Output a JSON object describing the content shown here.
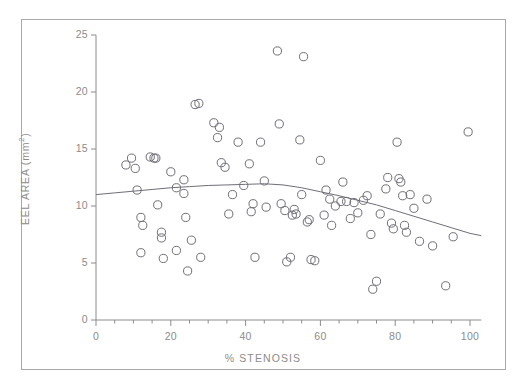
{
  "figure": {
    "background": "#ffffff",
    "frame_color": "#a8a8a8",
    "axis_color": "#8c8c8c",
    "marker_color": "#6e6e78",
    "trend_color": "#6e6e78"
  },
  "axes": {
    "x_title": "% STENOSIS",
    "y_title_main": "EEL AREA (mm",
    "y_title_sup": "2",
    "y_title_tail": ")",
    "x_ticks": [
      "0",
      "20",
      "40",
      "60",
      "80",
      "100"
    ],
    "y_ticks": [
      "0",
      "5",
      "10",
      "15",
      "20",
      "25"
    ]
  },
  "chart_data": {
    "type": "scatter",
    "title": "",
    "xlabel": "% STENOSIS",
    "ylabel": "EEL AREA (mm2)",
    "xlim": [
      0,
      103
    ],
    "ylim": [
      0,
      25
    ],
    "x_major_ticks": [
      0,
      20,
      40,
      60,
      80,
      100
    ],
    "y_major_ticks": [
      0,
      5,
      10,
      15,
      20,
      25
    ],
    "x_minor_tick_step": 5,
    "grid": false,
    "legend": null,
    "marker": "open-circle",
    "series": [
      {
        "name": "observations",
        "points": [
          [
            8.0,
            13.6
          ],
          [
            9.5,
            14.2
          ],
          [
            10.5,
            13.3
          ],
          [
            11.0,
            11.4
          ],
          [
            12.0,
            9.0
          ],
          [
            12.5,
            8.3
          ],
          [
            12.0,
            5.9
          ],
          [
            14.5,
            14.3
          ],
          [
            15.5,
            14.2
          ],
          [
            16.0,
            14.2
          ],
          [
            16.5,
            10.1
          ],
          [
            17.5,
            7.7
          ],
          [
            17.5,
            7.2
          ],
          [
            18.0,
            5.4
          ],
          [
            20.0,
            13.0
          ],
          [
            21.5,
            11.6
          ],
          [
            21.5,
            6.1
          ],
          [
            23.5,
            12.3
          ],
          [
            23.5,
            11.1
          ],
          [
            24.0,
            9.0
          ],
          [
            24.5,
            4.3
          ],
          [
            25.5,
            7.0
          ],
          [
            26.5,
            18.9
          ],
          [
            27.5,
            19.0
          ],
          [
            28.0,
            5.5
          ],
          [
            31.5,
            17.3
          ],
          [
            32.5,
            16.0
          ],
          [
            33.0,
            16.9
          ],
          [
            33.5,
            13.8
          ],
          [
            34.5,
            13.4
          ],
          [
            35.5,
            9.3
          ],
          [
            36.5,
            11.0
          ],
          [
            38.0,
            15.6
          ],
          [
            39.5,
            11.8
          ],
          [
            41.0,
            13.7
          ],
          [
            41.5,
            9.5
          ],
          [
            42.0,
            10.2
          ],
          [
            42.5,
            5.5
          ],
          [
            44.0,
            15.6
          ],
          [
            45.0,
            12.2
          ],
          [
            45.5,
            9.9
          ],
          [
            48.5,
            23.6
          ],
          [
            49.0,
            17.2
          ],
          [
            49.5,
            10.2
          ],
          [
            50.5,
            9.6
          ],
          [
            51.0,
            5.1
          ],
          [
            52.0,
            5.5
          ],
          [
            52.5,
            9.2
          ],
          [
            53.0,
            9.7
          ],
          [
            53.5,
            9.3
          ],
          [
            54.5,
            15.8
          ],
          [
            55.5,
            23.1
          ],
          [
            55.0,
            11.0
          ],
          [
            56.5,
            8.6
          ],
          [
            57.0,
            8.8
          ],
          [
            57.5,
            5.3
          ],
          [
            58.5,
            5.2
          ],
          [
            60.0,
            14.0
          ],
          [
            61.0,
            9.2
          ],
          [
            61.5,
            11.4
          ],
          [
            62.5,
            10.6
          ],
          [
            63.0,
            8.3
          ],
          [
            64.0,
            10.0
          ],
          [
            65.5,
            10.4
          ],
          [
            66.0,
            12.1
          ],
          [
            67.0,
            10.4
          ],
          [
            68.0,
            8.9
          ],
          [
            69.0,
            10.3
          ],
          [
            70.0,
            9.4
          ],
          [
            71.5,
            10.5
          ],
          [
            72.5,
            10.9
          ],
          [
            73.5,
            7.5
          ],
          [
            74.0,
            2.7
          ],
          [
            75.0,
            3.4
          ],
          [
            76.0,
            9.3
          ],
          [
            77.5,
            11.5
          ],
          [
            78.0,
            12.5
          ],
          [
            79.0,
            8.5
          ],
          [
            79.5,
            8.0
          ],
          [
            80.5,
            15.6
          ],
          [
            81.0,
            12.4
          ],
          [
            81.5,
            12.1
          ],
          [
            82.0,
            10.9
          ],
          [
            82.5,
            8.3
          ],
          [
            83.0,
            7.7
          ],
          [
            84.0,
            11.0
          ],
          [
            85.0,
            9.8
          ],
          [
            86.5,
            6.9
          ],
          [
            88.5,
            10.6
          ],
          [
            90.0,
            6.5
          ],
          [
            93.5,
            3.0
          ],
          [
            95.5,
            7.3
          ],
          [
            99.5,
            16.5
          ]
        ]
      }
    ],
    "trend_line": {
      "name": "lowess-fit",
      "points": [
        [
          0.0,
          11.0
        ],
        [
          5.0,
          11.15
        ],
        [
          10.0,
          11.3
        ],
        [
          15.0,
          11.45
        ],
        [
          20.0,
          11.6
        ],
        [
          25.0,
          11.7
        ],
        [
          30.0,
          11.8
        ],
        [
          35.0,
          11.85
        ],
        [
          40.0,
          11.9
        ],
        [
          45.0,
          11.95
        ],
        [
          50.0,
          11.85
        ],
        [
          55.0,
          11.6
        ],
        [
          60.0,
          11.25
        ],
        [
          65.0,
          10.9
        ],
        [
          70.0,
          10.5
        ],
        [
          75.0,
          10.1
        ],
        [
          80.0,
          9.6
        ],
        [
          85.0,
          9.1
        ],
        [
          90.0,
          8.6
        ],
        [
          95.0,
          8.1
        ],
        [
          100.0,
          7.6
        ],
        [
          103.0,
          7.4
        ]
      ]
    }
  }
}
